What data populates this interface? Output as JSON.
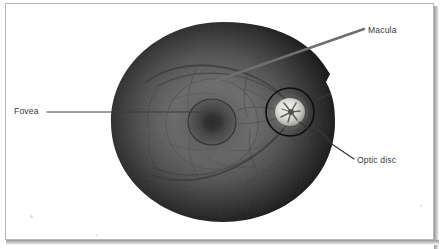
{
  "figure": {
    "kind": "retinal-fundus-photograph",
    "frame": {
      "border_color": "#b9b9b9",
      "background_color": "#ffffff",
      "shadow_color": "#9a9a9a"
    }
  },
  "fundus": {
    "name": "retina-fundus",
    "center_x": 223,
    "center_y": 122,
    "radius_x": 112,
    "radius_y": 100,
    "edge_color": "#0b0b0b",
    "mid_color": "#4a4a4a",
    "center_color": "#6e6e6e"
  },
  "structures": [
    {
      "id": "macula",
      "label": "Macula",
      "shape": "ring",
      "center_x": 212,
      "center_y": 124,
      "radius_x": 46,
      "radius_y": 45,
      "stroke_color": "#565656"
    },
    {
      "id": "fovea",
      "label": "Fovea",
      "shape": "circle",
      "center_x": 212,
      "center_y": 122,
      "radius_x": 24,
      "radius_y": 23,
      "fill_color": "#3f3f3f",
      "stroke_color": "#3a3a3a"
    },
    {
      "id": "optic-disc",
      "label": "Optic disc",
      "shape": "circle-outline",
      "center_x": 290,
      "center_y": 112,
      "radius_x": 24,
      "radius_y": 24,
      "stroke_color": "#0d0d0d",
      "disc_fill_color": "#e8e8e4",
      "disc_radius_x": 15,
      "disc_radius_y": 14
    }
  ],
  "annotations": [
    {
      "id": "macula",
      "label": "Macula",
      "text_x": 368,
      "text_y": 26,
      "leader": {
        "style": "thick",
        "color": "#6f6f6f",
        "width": 2.4,
        "x1": 215,
        "y1": 81,
        "x2": 364,
        "y2": 29
      }
    },
    {
      "id": "fovea",
      "label": "Fovea",
      "text_x": 14,
      "text_y": 107,
      "leader": {
        "style": "thin",
        "color": "#3c3c3c",
        "width": 1.0,
        "x1": 206,
        "y1": 112,
        "x2": 47,
        "y2": 112
      }
    },
    {
      "id": "optic-disc",
      "label": "Optic disc",
      "text_x": 357,
      "text_y": 156,
      "leader": {
        "style": "thin",
        "color": "#2e2e2e",
        "width": 1.1,
        "x1": 299,
        "y1": 122,
        "x2": 354,
        "y2": 159
      }
    }
  ],
  "vessels": {
    "stroke_color": "#3b3b3b",
    "arcade_color": "#454545",
    "count": 14
  }
}
